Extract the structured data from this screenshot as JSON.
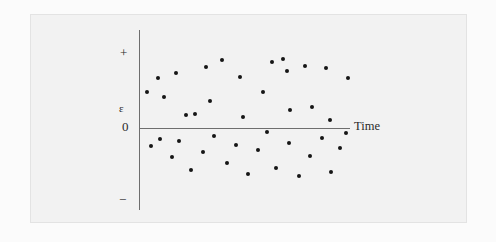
{
  "figure": {
    "background_color": "#f2f2f2",
    "page_color": "#ffffff",
    "point_color": "#161616",
    "axis_color": "#6e6e6e"
  },
  "axis_labels": {
    "plus": "+",
    "epsilon": "ε",
    "zero": "0",
    "minus": "−",
    "time": "Time"
  },
  "chart_data": {
    "type": "scatter",
    "title": "",
    "subtitle": "",
    "xlabel": "Time",
    "ylabel": "ε",
    "grid": false,
    "legend": null,
    "xlim": [
      0,
      100
    ],
    "ylim": [
      -1,
      1
    ],
    "ytick_labels": [
      "+",
      "0",
      "−"
    ],
    "ytick_values": [
      1,
      0,
      -1
    ],
    "xtick_labels": [],
    "annotations": [
      {
        "text": "ε",
        "position": "y-axis upper-middle"
      },
      {
        "text": "Time",
        "position": "right end of x-axis"
      }
    ],
    "series": [
      {
        "name": "residuals",
        "x": [
          6,
          11,
          14,
          20,
          23,
          25,
          28,
          34,
          41,
          46,
          53,
          57,
          60,
          63,
          67,
          71,
          76,
          80,
          85,
          90,
          95,
          4,
          8,
          13,
          17,
          22,
          27,
          31,
          36,
          41,
          47,
          52,
          56,
          61,
          66,
          70,
          74,
          79,
          84,
          88,
          93
        ],
        "y": [
          0.38,
          0.62,
          0.19,
          0.74,
          0.08,
          0.45,
          0.31,
          0.52,
          0.7,
          0.12,
          0.56,
          0.27,
          0.63,
          0.41,
          0.35,
          0.58,
          0.22,
          0.66,
          0.48,
          0.05,
          0.5,
          -0.24,
          -0.41,
          -0.13,
          -0.55,
          -0.3,
          -0.68,
          -0.18,
          -0.47,
          -0.62,
          -0.09,
          -0.36,
          -0.58,
          -0.26,
          -0.7,
          -0.15,
          -0.44,
          -0.33,
          -0.6,
          -0.21,
          -0.5
        ],
        "marker": "circle",
        "color": "#161616"
      }
    ]
  },
  "points": [
    {
      "x": 164,
      "y": 97
    },
    {
      "x": 176,
      "y": 73
    },
    {
      "x": 186,
      "y": 115
    },
    {
      "x": 195,
      "y": 114
    },
    {
      "x": 206,
      "y": 67
    },
    {
      "x": 210,
      "y": 101
    },
    {
      "x": 240,
      "y": 77
    },
    {
      "x": 243,
      "y": 117
    },
    {
      "x": 263,
      "y": 92
    },
    {
      "x": 272,
      "y": 62
    },
    {
      "x": 287,
      "y": 71
    },
    {
      "x": 290,
      "y": 110
    },
    {
      "x": 305,
      "y": 66
    },
    {
      "x": 312,
      "y": 107
    },
    {
      "x": 326,
      "y": 68
    },
    {
      "x": 330,
      "y": 120
    },
    {
      "x": 348,
      "y": 78
    },
    {
      "x": 283,
      "y": 59
    },
    {
      "x": 222,
      "y": 60
    },
    {
      "x": 147,
      "y": 92
    },
    {
      "x": 158,
      "y": 78
    },
    {
      "x": 151,
      "y": 146
    },
    {
      "x": 160,
      "y": 139
    },
    {
      "x": 172,
      "y": 157
    },
    {
      "x": 179,
      "y": 141
    },
    {
      "x": 191,
      "y": 170
    },
    {
      "x": 203,
      "y": 152
    },
    {
      "x": 214,
      "y": 136
    },
    {
      "x": 227,
      "y": 163
    },
    {
      "x": 236,
      "y": 145
    },
    {
      "x": 248,
      "y": 174
    },
    {
      "x": 258,
      "y": 150
    },
    {
      "x": 267,
      "y": 132
    },
    {
      "x": 276,
      "y": 168
    },
    {
      "x": 289,
      "y": 143
    },
    {
      "x": 299,
      "y": 176
    },
    {
      "x": 310,
      "y": 156
    },
    {
      "x": 322,
      "y": 138
    },
    {
      "x": 331,
      "y": 172
    },
    {
      "x": 340,
      "y": 148
    },
    {
      "x": 346,
      "y": 133
    }
  ]
}
